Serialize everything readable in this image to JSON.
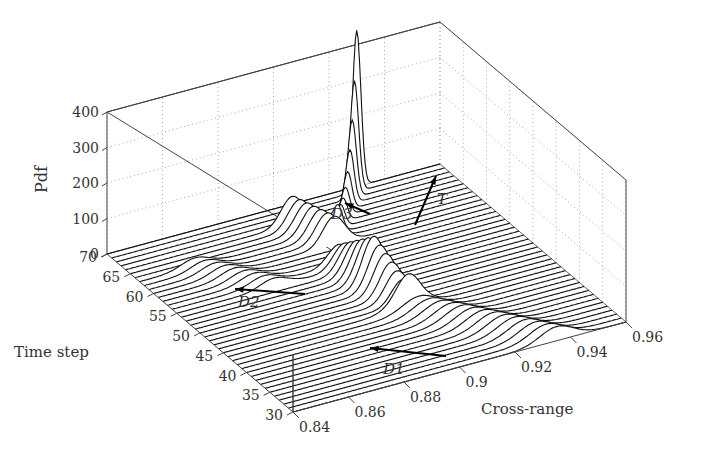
{
  "chart_data": {
    "type": "waterfall-3d",
    "title": "",
    "xlabel": "Cross-range",
    "ylabel": "Time step",
    "zlabel": "Pdf",
    "x_ticks": [
      "0.84",
      "0.86",
      "0.88",
      "0.9",
      "0.92",
      "0.94",
      "0.96"
    ],
    "y_ticks": [
      "30",
      "35",
      "40",
      "45",
      "50",
      "55",
      "60",
      "65",
      "70"
    ],
    "z_ticks": [
      "0",
      "100",
      "200",
      "300",
      "400"
    ],
    "xlim": [
      0.84,
      0.96
    ],
    "ylim": [
      30,
      70
    ],
    "zlim": [
      0,
      400
    ],
    "grid": true,
    "time_steps": {
      "start": 30,
      "end": 70,
      "step": 1
    },
    "components": [
      {
        "name": "D1",
        "t_range": [
          30,
          44
        ],
        "center_start": 0.935,
        "center_end": 0.905,
        "width": 0.006,
        "peak": 40
      },
      {
        "name": "main",
        "t_range": [
          44,
          56
        ],
        "center_start": 0.905,
        "center_end": 0.9,
        "width": 0.004,
        "peak": 140
      },
      {
        "name": "D2",
        "t_range": [
          55,
          63
        ],
        "center_start": 0.875,
        "center_end": 0.86,
        "width": 0.005,
        "peak": 25
      },
      {
        "name": "D3",
        "t_range": [
          60,
          66
        ],
        "center_start": 0.905,
        "center_end": 0.9,
        "width": 0.004,
        "peak": 80
      },
      {
        "name": "T",
        "t_range": [
          62,
          70
        ],
        "center_start": 0.91,
        "center_end": 0.93,
        "width": 0.0015,
        "peak": 380
      }
    ],
    "annotations": [
      {
        "label": "D1",
        "x": 0.905,
        "t": 38
      },
      {
        "label": "D2",
        "x": 0.865,
        "t": 58
      },
      {
        "label": "D3",
        "x": 0.9,
        "t": 65
      },
      {
        "label": "T",
        "x": 0.925,
        "t": 64
      }
    ]
  },
  "labels": {
    "zlabel": "Pdf",
    "ylabel": "Time step",
    "xlabel": "Cross-range",
    "D1": "D1",
    "D2": "D2",
    "D3": "D3",
    "T": "T"
  }
}
